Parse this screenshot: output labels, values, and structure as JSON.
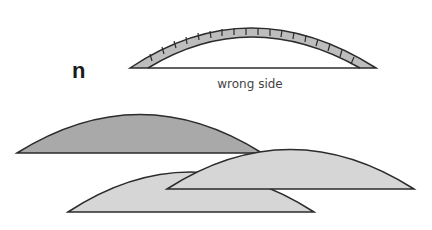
{
  "figure": {
    "step_label": "n",
    "caption": "wrong side",
    "colors": {
      "outline": "#2b2b2b",
      "arch_fill": "#bdbdbd",
      "dark_fill": "#a9a9a9",
      "light_fill": "#d6d6d6",
      "caption": "#444444"
    },
    "shapes": [
      {
        "name": "curved-strip-wrong-side",
        "left": 130,
        "right": 376,
        "base_y": 68,
        "top_y": 27
      },
      {
        "name": "dark-dome",
        "left": 17,
        "right": 262,
        "base_y": 153,
        "top_y": 114
      },
      {
        "name": "light-dome-lower",
        "left": 68,
        "right": 314,
        "base_y": 212,
        "top_y": 171
      },
      {
        "name": "light-dome-right",
        "left": 167,
        "right": 414,
        "base_y": 189,
        "top_y": 149
      }
    ]
  }
}
